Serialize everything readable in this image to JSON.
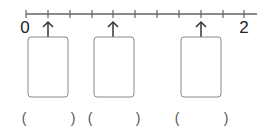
{
  "number_line": {
    "start_label": "0",
    "end_label": "2",
    "min": 0,
    "max": 2,
    "tick_step": 0.2,
    "tick_count": 11,
    "line_color": "#666666"
  },
  "markers": [
    {
      "value": 0.2,
      "answer_box": "",
      "answer_paren": ""
    },
    {
      "value": 0.8,
      "answer_box": "",
      "answer_paren": ""
    },
    {
      "value": 1.6,
      "answer_box": "",
      "answer_paren": ""
    }
  ],
  "parens": [
    {
      "open": "(",
      "close": ")"
    },
    {
      "open": "(",
      "close": ")"
    },
    {
      "open": "(",
      "close": ")"
    }
  ]
}
